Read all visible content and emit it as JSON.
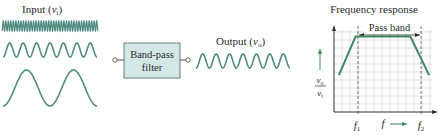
{
  "input": {
    "label": "Input (",
    "var": "v",
    "sub": "i",
    "close": ")",
    "waves": [
      {
        "name": "high-frequency",
        "cycles": 38
      },
      {
        "name": "mid-frequency",
        "cycles": 7
      },
      {
        "name": "low-frequency",
        "cycles": 2
      }
    ]
  },
  "filter": {
    "line1": "Band-pass",
    "line2": "filter"
  },
  "output": {
    "label": "Output (",
    "var": "v",
    "sub": "o",
    "close": ")",
    "cycles": 7
  },
  "chart_data": {
    "type": "line",
    "title": "Frequency response",
    "xlabel": "f",
    "ylabel": "v_o / v_i",
    "annotation": "Pass band",
    "x_ticks": [
      "f1",
      "f2"
    ],
    "grid": true,
    "series": [
      {
        "name": "response",
        "points": [
          [
            0.05,
            0.45
          ],
          [
            0.22,
            0.92
          ],
          [
            0.78,
            0.92
          ],
          [
            0.97,
            0.45
          ]
        ]
      }
    ]
  },
  "colors": {
    "wave": "#4f8a7e",
    "filter_fill": "#d5e6e6",
    "grid": "#c8c8c8",
    "response": "#3f8a5e"
  }
}
